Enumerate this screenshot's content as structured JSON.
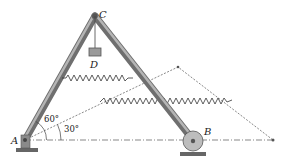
{
  "figure": {
    "points": {
      "A": {
        "label": "A",
        "x": 25,
        "y": 140
      },
      "B": {
        "label": "B",
        "x": 193,
        "y": 140
      },
      "C": {
        "label": "C",
        "x": 95,
        "y": 16
      },
      "D": {
        "label": "D"
      },
      "far": {
        "x": 273,
        "y": 140
      },
      "apex": {
        "x": 178,
        "y": 67
      }
    },
    "angles": {
      "a60": "60°",
      "a30": "30°"
    },
    "colors": {
      "member": "#8a8a8a",
      "member_dark": "#5a5a5a",
      "line": "#444444",
      "ground": "#5a5a5a",
      "block": "#9a9a9a"
    }
  }
}
